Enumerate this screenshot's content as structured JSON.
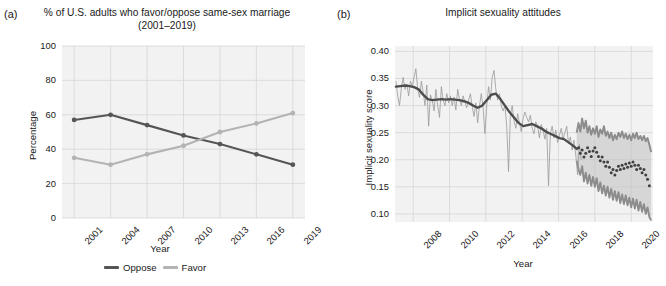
{
  "figure": {
    "panels": [
      {
        "letter": "(a)",
        "title": "% of U.S. adults who favor/oppose same-sex marriage (2001–2019)"
      },
      {
        "letter": "(b)",
        "title": "Implicit sexuality attitudes"
      }
    ]
  },
  "colors": {
    "oppose_line": "#555555",
    "favor_line": "#b3b3b3",
    "panel_bg": "#f2f2f2",
    "gridline": "#d9d9d9",
    "trend_line": "#4d4d4d",
    "noise_line": "#999999",
    "band_fill": "#bfbfbf",
    "band_edge": "#8c8c8c",
    "forecast_dots": "#404040",
    "text": "#1a1a1a"
  },
  "chart_data": [
    {
      "type": "line",
      "panel": "a",
      "title": "% of U.S. adults who favor/oppose same-sex marriage (2001–2019)",
      "xlabel": "Year",
      "ylabel": "Percentage",
      "xlim": [
        2000,
        2020
      ],
      "ylim": [
        0,
        100
      ],
      "yticks": [
        0,
        20,
        40,
        60,
        80,
        100
      ],
      "ytick_labels": [
        "0",
        "20",
        "40",
        "60",
        "80",
        "100"
      ],
      "xticks": [
        2001,
        2004,
        2007,
        2010,
        2013,
        2016,
        2019
      ],
      "xtick_labels": [
        "2001",
        "2004",
        "2007",
        "2010",
        "2013",
        "2016",
        "2019"
      ],
      "grid": true,
      "legend_position": "bottom",
      "categories": [
        2001,
        2004,
        2007,
        2010,
        2013,
        2016,
        2019
      ],
      "series": [
        {
          "name": "Oppose",
          "color": "#555555",
          "marker": true,
          "values": [
            57,
            60,
            54,
            48,
            43,
            37,
            31
          ]
        },
        {
          "name": "Favor",
          "color": "#b3b3b3",
          "marker": true,
          "values": [
            35,
            31,
            37,
            42,
            50,
            55,
            61
          ]
        }
      ],
      "annotations": [
        "Oppose and Favor series cross between 2011 and 2012"
      ]
    },
    {
      "type": "line",
      "panel": "b",
      "title": "Implicit sexuality attitudes",
      "xlabel": "Year",
      "ylabel": "Implicit sexuality score",
      "xlim": [
        2007.0,
        2021.2
      ],
      "ylim": [
        0.085,
        0.41
      ],
      "yticks": [
        0.1,
        0.15,
        0.2,
        0.25,
        0.3,
        0.35,
        0.4
      ],
      "ytick_labels": [
        "0.10",
        "0.15",
        "0.20",
        "0.25",
        "0.30",
        "0.35",
        "0.40"
      ],
      "xticks": [
        2008,
        2010,
        2012,
        2014,
        2016,
        2018,
        2020
      ],
      "xtick_labels": [
        "2008",
        "2010",
        "2012",
        "2014",
        "2016",
        "2018",
        "2020"
      ],
      "grid": true,
      "legend_position": "none",
      "forecast_start": 2017.0,
      "series": [
        {
          "name": "Observed monthly score",
          "role": "noise",
          "color": "#999999",
          "x": [
            2007.05,
            2007.15,
            2007.25,
            2007.35,
            2007.45,
            2007.55,
            2007.65,
            2007.75,
            2007.85,
            2007.95,
            2008.05,
            2008.15,
            2008.25,
            2008.35,
            2008.45,
            2008.55,
            2008.65,
            2008.75,
            2008.85,
            2008.95,
            2009.05,
            2009.15,
            2009.25,
            2009.35,
            2009.45,
            2009.55,
            2009.65,
            2009.75,
            2009.85,
            2009.95,
            2010.05,
            2010.15,
            2010.25,
            2010.35,
            2010.45,
            2010.55,
            2010.65,
            2010.75,
            2010.85,
            2010.95,
            2011.05,
            2011.15,
            2011.25,
            2011.35,
            2011.45,
            2011.55,
            2011.65,
            2011.75,
            2011.85,
            2011.95,
            2012.05,
            2012.15,
            2012.25,
            2012.35,
            2012.45,
            2012.55,
            2012.65,
            2012.75,
            2012.85,
            2012.95,
            2013.05,
            2013.15,
            2013.25,
            2013.35,
            2013.45,
            2013.55,
            2013.65,
            2013.75,
            2013.85,
            2013.95,
            2014.05,
            2014.15,
            2014.25,
            2014.35,
            2014.45,
            2014.55,
            2014.65,
            2014.75,
            2014.85,
            2014.95,
            2015.05,
            2015.15,
            2015.25,
            2015.35,
            2015.45,
            2015.55,
            2015.65,
            2015.75,
            2015.85,
            2015.95,
            2016.05,
            2016.15,
            2016.25,
            2016.35,
            2016.45,
            2016.55,
            2016.65,
            2016.75,
            2016.85,
            2016.95,
            2017.05,
            2017.15,
            2017.25
          ],
          "values": [
            0.345,
            0.318,
            0.3,
            0.332,
            0.352,
            0.33,
            0.34,
            0.318,
            0.345,
            0.335,
            0.352,
            0.368,
            0.33,
            0.315,
            0.345,
            0.325,
            0.3,
            0.338,
            0.262,
            0.32,
            0.31,
            0.29,
            0.33,
            0.3,
            0.278,
            0.335,
            0.31,
            0.3,
            0.322,
            0.305,
            0.318,
            0.3,
            0.316,
            0.292,
            0.33,
            0.312,
            0.3,
            0.318,
            0.306,
            0.296,
            0.31,
            0.322,
            0.298,
            0.28,
            0.305,
            0.268,
            0.3,
            0.322,
            0.296,
            0.248,
            0.3,
            0.335,
            0.31,
            0.352,
            0.365,
            0.33,
            0.31,
            0.322,
            0.3,
            0.29,
            0.3,
            0.262,
            0.178,
            0.282,
            0.3,
            0.272,
            0.258,
            0.285,
            0.268,
            0.252,
            0.276,
            0.288,
            0.278,
            0.27,
            0.282,
            0.258,
            0.248,
            0.27,
            0.262,
            0.24,
            0.265,
            0.255,
            0.238,
            0.258,
            0.152,
            0.248,
            0.262,
            0.24,
            0.255,
            0.232,
            0.245,
            0.258,
            0.238,
            0.25,
            0.262,
            0.23,
            0.242,
            0.218,
            0.236,
            0.208,
            0.172,
            0.228,
            0.2
          ]
        },
        {
          "name": "Smoothed trend",
          "role": "trend",
          "color": "#4d4d4d",
          "x": [
            2007.05,
            2007.3,
            2007.55,
            2007.8,
            2008.05,
            2008.3,
            2008.55,
            2008.8,
            2009.05,
            2009.3,
            2009.55,
            2009.8,
            2010.05,
            2010.3,
            2010.55,
            2010.8,
            2011.05,
            2011.3,
            2011.55,
            2011.8,
            2012.05,
            2012.3,
            2012.55,
            2012.8,
            2013.05,
            2013.3,
            2013.55,
            2013.8,
            2014.05,
            2014.3,
            2014.55,
            2014.8,
            2015.05,
            2015.3,
            2015.55,
            2015.8,
            2016.05,
            2016.3,
            2016.55,
            2016.8,
            2017.0
          ],
          "values": [
            0.335,
            0.336,
            0.337,
            0.336,
            0.334,
            0.33,
            0.32,
            0.312,
            0.31,
            0.311,
            0.312,
            0.311,
            0.312,
            0.311,
            0.31,
            0.308,
            0.305,
            0.3,
            0.296,
            0.3,
            0.31,
            0.32,
            0.322,
            0.312,
            0.3,
            0.288,
            0.278,
            0.268,
            0.262,
            0.264,
            0.266,
            0.262,
            0.258,
            0.252,
            0.248,
            0.244,
            0.24,
            0.238,
            0.232,
            0.226,
            0.22
          ]
        },
        {
          "name": "Forecast mean",
          "role": "forecast-dots",
          "color": "#404040",
          "x": [
            2017.1,
            2017.2,
            2017.3,
            2017.4,
            2017.5,
            2017.6,
            2017.7,
            2017.8,
            2017.9,
            2018.0,
            2018.1,
            2018.2,
            2018.3,
            2018.4,
            2018.5,
            2018.6,
            2018.7,
            2018.8,
            2018.9,
            2019.0,
            2019.1,
            2019.2,
            2019.3,
            2019.4,
            2019.5,
            2019.6,
            2019.7,
            2019.8,
            2019.9,
            2020.0,
            2020.1,
            2020.2,
            2020.3,
            2020.4,
            2020.5,
            2020.6,
            2020.7,
            2020.8,
            2020.9,
            2021.0
          ],
          "values": [
            0.222,
            0.212,
            0.218,
            0.205,
            0.212,
            0.222,
            0.215,
            0.206,
            0.216,
            0.222,
            0.214,
            0.206,
            0.198,
            0.205,
            0.196,
            0.188,
            0.196,
            0.186,
            0.176,
            0.182,
            0.172,
            0.18,
            0.188,
            0.182,
            0.19,
            0.184,
            0.192,
            0.186,
            0.194,
            0.188,
            0.196,
            0.19,
            0.182,
            0.19,
            0.184,
            0.176,
            0.182,
            0.172,
            0.164,
            0.152
          ]
        },
        {
          "name": "Forecast interval upper",
          "role": "band-upper",
          "color": "#8c8c8c",
          "x": [
            2017.0,
            2017.1,
            2017.2,
            2017.3,
            2017.4,
            2017.5,
            2017.6,
            2017.7,
            2017.8,
            2017.9,
            2018.0,
            2018.1,
            2018.2,
            2018.3,
            2018.4,
            2018.5,
            2018.6,
            2018.7,
            2018.8,
            2018.9,
            2019.0,
            2019.1,
            2019.2,
            2019.3,
            2019.4,
            2019.5,
            2019.6,
            2019.7,
            2019.8,
            2019.9,
            2020.0,
            2020.1,
            2020.2,
            2020.3,
            2020.4,
            2020.5,
            2020.6,
            2020.7,
            2020.8,
            2020.9,
            2021.0,
            2021.1
          ],
          "values": [
            0.25,
            0.268,
            0.252,
            0.276,
            0.258,
            0.272,
            0.25,
            0.262,
            0.246,
            0.258,
            0.248,
            0.262,
            0.242,
            0.256,
            0.248,
            0.262,
            0.244,
            0.252,
            0.24,
            0.25,
            0.236,
            0.246,
            0.238,
            0.25,
            0.242,
            0.252,
            0.24,
            0.248,
            0.238,
            0.246,
            0.236,
            0.248,
            0.24,
            0.25,
            0.238,
            0.244,
            0.236,
            0.244,
            0.234,
            0.24,
            0.228,
            0.214
          ]
        },
        {
          "name": "Forecast interval lower",
          "role": "band-lower",
          "color": "#8c8c8c",
          "x": [
            2017.0,
            2017.1,
            2017.2,
            2017.3,
            2017.4,
            2017.5,
            2017.6,
            2017.7,
            2017.8,
            2017.9,
            2018.0,
            2018.1,
            2018.2,
            2018.3,
            2018.4,
            2018.5,
            2018.6,
            2018.7,
            2018.8,
            2018.9,
            2019.0,
            2019.1,
            2019.2,
            2019.3,
            2019.4,
            2019.5,
            2019.6,
            2019.7,
            2019.8,
            2019.9,
            2020.0,
            2020.1,
            2020.2,
            2020.3,
            2020.4,
            2020.5,
            2020.6,
            2020.7,
            2020.8,
            2020.9,
            2021.0,
            2021.1
          ],
          "values": [
            0.198,
            0.182,
            0.172,
            0.188,
            0.16,
            0.176,
            0.156,
            0.172,
            0.152,
            0.168,
            0.15,
            0.166,
            0.142,
            0.158,
            0.138,
            0.152,
            0.134,
            0.15,
            0.13,
            0.146,
            0.126,
            0.142,
            0.124,
            0.14,
            0.12,
            0.136,
            0.118,
            0.134,
            0.116,
            0.13,
            0.112,
            0.128,
            0.11,
            0.126,
            0.106,
            0.122,
            0.104,
            0.118,
            0.1,
            0.112,
            0.094,
            0.088
          ]
        }
      ]
    }
  ]
}
